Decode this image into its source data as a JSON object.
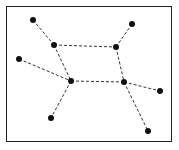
{
  "diagram": {
    "type": "graph",
    "caption": "",
    "nodes": [
      {
        "id": "n1",
        "x": 33,
        "y": 20
      },
      {
        "id": "n2",
        "x": 132,
        "y": 24
      },
      {
        "id": "n3",
        "x": 54,
        "y": 45
      },
      {
        "id": "n4",
        "x": 116,
        "y": 47
      },
      {
        "id": "n5",
        "x": 19,
        "y": 59
      },
      {
        "id": "n6",
        "x": 71,
        "y": 81
      },
      {
        "id": "n7",
        "x": 124,
        "y": 82
      },
      {
        "id": "n8",
        "x": 160,
        "y": 91
      },
      {
        "id": "n9",
        "x": 51,
        "y": 118
      },
      {
        "id": "n10",
        "x": 148,
        "y": 131
      }
    ],
    "edges": [
      [
        "n1",
        "n3"
      ],
      [
        "n3",
        "n4"
      ],
      [
        "n4",
        "n2"
      ],
      [
        "n3",
        "n6"
      ],
      [
        "n4",
        "n7"
      ],
      [
        "n5",
        "n6"
      ],
      [
        "n6",
        "n7"
      ],
      [
        "n7",
        "n8"
      ],
      [
        "n6",
        "n9"
      ],
      [
        "n7",
        "n10"
      ]
    ],
    "edge_style": "dashed",
    "node_color": "#111111",
    "edge_color": "#333333"
  }
}
